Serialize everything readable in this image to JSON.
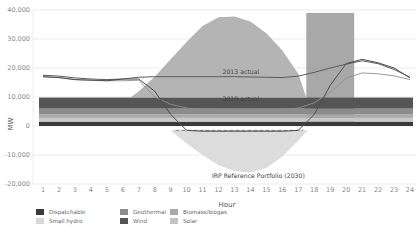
{
  "chart_data": {
    "type": "area",
    "title": "",
    "xlabel": "Hour",
    "ylabel": "MW",
    "ylim": [
      -20000,
      40000
    ],
    "yticks": [
      40000,
      30000,
      20000,
      10000,
      0,
      -10000,
      -20000
    ],
    "ytick_labels": [
      "40,000",
      "30,000",
      "20,000",
      "10,000",
      "0",
      "-10,000",
      "-20,000"
    ],
    "x": [
      1,
      2,
      3,
      4,
      5,
      6,
      7,
      8,
      9,
      10,
      11,
      12,
      13,
      14,
      15,
      16,
      17,
      18,
      19,
      20,
      21,
      22,
      23,
      24
    ],
    "xtick_labels": [
      "1",
      "2",
      "3",
      "4",
      "5",
      "6",
      "7",
      "8",
      "9",
      "10",
      "11",
      "12",
      "13",
      "14",
      "15",
      "16",
      "17",
      "18",
      "19",
      "20",
      "21",
      "22",
      "23",
      "24"
    ],
    "grid": "horizontal",
    "stacked_bands": [
      {
        "name": "Dispatchable",
        "from": 0,
        "to": 1500,
        "color": "#3a3a3a"
      },
      {
        "name": "Small hydro",
        "from": 1500,
        "to": 2800,
        "color": "#c8c8c8"
      },
      {
        "name": "Biomass/biogas",
        "from": 2800,
        "to": 4000,
        "color": "#a9a9a9"
      },
      {
        "name": "Geothermal",
        "from": 4000,
        "to": 6000,
        "color": "#8c8c8c"
      },
      {
        "name": "Wind",
        "from": 6000,
        "to": 9800,
        "color": "#555555"
      }
    ],
    "solar_area": {
      "name": "Solar",
      "color": "#b4b4b4",
      "points": [
        [
          6.5,
          9800
        ],
        [
          7,
          12000
        ],
        [
          8,
          17000
        ],
        [
          9,
          23000
        ],
        [
          10,
          29000
        ],
        [
          11,
          34500
        ],
        [
          12,
          37500
        ],
        [
          13,
          37800
        ],
        [
          14,
          36000
        ],
        [
          15,
          32000
        ],
        [
          16,
          26000
        ],
        [
          17,
          18000
        ],
        [
          17.5,
          9800
        ]
      ]
    },
    "evening_block": {
      "x_from": 17.5,
      "x_to": 20.5,
      "y_from": 0,
      "y_to": 39000,
      "color": "#a8a8a8"
    },
    "series": [
      {
        "name": "2013 actual",
        "color": "#5a5a5a",
        "values": [
          17500,
          17200,
          16600,
          16200,
          16000,
          16200,
          16800,
          17000,
          17000,
          17000,
          17000,
          17000,
          17000,
          16900,
          16800,
          16700,
          17200,
          18500,
          20000,
          21300,
          22500,
          21500,
          19500,
          16800
        ]
      },
      {
        "name": "2019 actual",
        "color": "#8e8e8e",
        "values": [
          17000,
          16700,
          16000,
          15800,
          15600,
          15600,
          15800,
          10000,
          7500,
          6200,
          5600,
          5200,
          5000,
          5000,
          5100,
          5400,
          6200,
          8000,
          11500,
          16500,
          18300,
          18000,
          17300,
          16000
        ]
      },
      {
        "name": "IRP Reference Portfolio (2030)",
        "color": "#4d4d4d",
        "values": [
          17000,
          16700,
          16000,
          15800,
          15600,
          16200,
          16200,
          12000,
          4000,
          -1500,
          -1800,
          -1800,
          -1800,
          -1800,
          -1800,
          -1800,
          -1500,
          4000,
          14000,
          21500,
          23000,
          21800,
          20000,
          16600
        ]
      }
    ],
    "irp_negative_area": {
      "name": "IRP Reference Portfolio (2030)",
      "color": "#dcdcdc",
      "points": [
        [
          9,
          -1500
        ],
        [
          10,
          -6000
        ],
        [
          11,
          -10000
        ],
        [
          12,
          -13500
        ],
        [
          13,
          -15500
        ],
        [
          14,
          -16000
        ],
        [
          15,
          -14500
        ],
        [
          16,
          -10500
        ],
        [
          17,
          -5000
        ],
        [
          17.6,
          -1500
        ]
      ]
    },
    "annotations": [
      {
        "text": "2013 actual",
        "x": 13.4,
        "y": 17800
      },
      {
        "text": "2019 actual",
        "x": 13.4,
        "y": 8600
      },
      {
        "text": "IRP Reference Portfolio (2030)",
        "x": 14.5,
        "y": -18000
      }
    ],
    "legend": {
      "position": "bottom-left",
      "entries": [
        {
          "label": "Dispatchable",
          "color": "#3a3a3a"
        },
        {
          "label": "Geothermal",
          "color": "#8c8c8c"
        },
        {
          "label": "Biomass/biogas",
          "color": "#a9a9a9"
        },
        {
          "label": "Small hydro",
          "color": "#d8d8d8"
        },
        {
          "label": "Wind",
          "color": "#555555"
        },
        {
          "label": "Solar",
          "color": "#c4c4c4"
        }
      ]
    }
  }
}
